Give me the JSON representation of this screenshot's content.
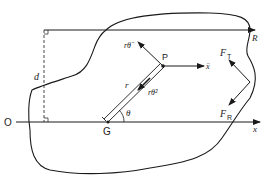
{
  "diagram": {
    "labels": {
      "origin": "O",
      "centroid": "G",
      "point": "P",
      "distance": "d",
      "radius_line": "r",
      "top_arrow": "R",
      "x_axis": "x",
      "angle": "θ",
      "tangential_accel": "rθ̈",
      "centripetal_accel": "rθ̇²",
      "x_accel": "ẍ",
      "force_tangential_base": "F",
      "force_tangential_sub": "T",
      "force_radial_base": "F",
      "force_radial_sub": "R"
    },
    "colors": {
      "stroke": "#1a1a1a",
      "background": "#ffffff"
    }
  }
}
